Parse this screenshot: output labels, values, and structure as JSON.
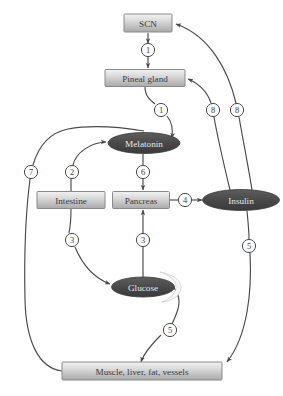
{
  "diagram": {
    "type": "flow-diagram",
    "canvas": {
      "width": 283,
      "height": 396
    },
    "colors": {
      "box_fill_light": "#e6e6e6",
      "box_fill_dark": "#b5b5b5",
      "box_stroke": "#8a8a8a",
      "box_text": "#3a3a3a",
      "ellipse_fill": "#4a4a4a",
      "ellipse_text": "#e8e8e8",
      "edge_stroke": "#4a4a4a",
      "circle_fill": "#ffffff",
      "background": "#ffffff"
    },
    "nodes": [
      {
        "id": "scn",
        "label": "SCN",
        "shape": "box",
        "cx": 148,
        "cy": 23,
        "w": 48,
        "h": 18
      },
      {
        "id": "pineal",
        "label": "Pineal gland",
        "shape": "box",
        "cx": 145,
        "cy": 78,
        "w": 80,
        "h": 17
      },
      {
        "id": "melatonin",
        "label": "Melatonin",
        "shape": "ellipse",
        "cx": 144,
        "cy": 143,
        "w": 72,
        "h": 21
      },
      {
        "id": "intestine",
        "label": "Intestine",
        "shape": "box",
        "cx": 71,
        "cy": 200,
        "w": 68,
        "h": 17
      },
      {
        "id": "pancreas",
        "label": "Pancreas",
        "shape": "box",
        "cx": 141,
        "cy": 200,
        "w": 57,
        "h": 17
      },
      {
        "id": "insulin",
        "label": "Insulin",
        "shape": "ellipse",
        "cx": 241,
        "cy": 200,
        "w": 77,
        "h": 21
      },
      {
        "id": "glucose",
        "label": "Glucose",
        "shape": "ellipse",
        "cx": 143,
        "cy": 287,
        "w": 63,
        "h": 20
      },
      {
        "id": "tissues",
        "label": "Muscle, liver, fat, vessels",
        "shape": "box",
        "cx": 142,
        "cy": 371,
        "w": 160,
        "h": 18
      }
    ],
    "edges": [
      {
        "id": "e1",
        "from": "scn",
        "to": "pineal",
        "number": "1",
        "nx": 148,
        "ny": 50
      },
      {
        "id": "e2",
        "from": "pineal",
        "to": "melatonin",
        "number": "1",
        "nx": 161,
        "ny": 110
      },
      {
        "id": "e3",
        "from": "melatonin",
        "to": "pancreas",
        "number": "6",
        "nx": 143,
        "ny": 172
      },
      {
        "id": "e4",
        "from": "pancreas",
        "to": "insulin",
        "number": "4",
        "nx": 185,
        "ny": 200
      },
      {
        "id": "e5",
        "from": "intestine",
        "to": "melatonin",
        "number": "2",
        "nx": 72,
        "ny": 172
      },
      {
        "id": "e6",
        "from": "tissues",
        "to": "melatonin",
        "number": "7",
        "nx": 31,
        "ny": 172
      },
      {
        "id": "e7",
        "from": "intestine",
        "to": "glucose",
        "number": "3",
        "nx": 72,
        "ny": 240
      },
      {
        "id": "e8",
        "from": "glucose",
        "to": "pancreas",
        "number": "3",
        "nx": 143,
        "ny": 240
      },
      {
        "id": "e9",
        "from": "glucose",
        "to": "tissues",
        "number": "5",
        "nx": 170,
        "ny": 330
      },
      {
        "id": "e10",
        "from": "insulin",
        "to": "tissues",
        "number": "5",
        "nx": 249,
        "ny": 246
      },
      {
        "id": "e11",
        "from": "insulin",
        "to": "pineal",
        "number": "8",
        "nx": 213,
        "ny": 110
      },
      {
        "id": "e12",
        "from": "insulin",
        "to": "scn",
        "number": "8",
        "nx": 237,
        "ny": 110
      }
    ]
  }
}
